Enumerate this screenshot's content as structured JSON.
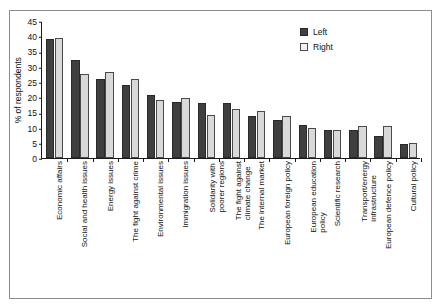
{
  "chart_data": {
    "type": "bar",
    "title": "",
    "subtitle": "",
    "xlabel": "",
    "ylabel": "% of respondents",
    "ylim": [
      0,
      45
    ],
    "ytick_step": 5,
    "yticks": [
      "45",
      "40",
      "35",
      "30",
      "25",
      "20",
      "15",
      "10",
      "5",
      "0"
    ],
    "grid": false,
    "legend_position": "top-right",
    "categories": [
      "Economic affairs",
      "Social and health issues",
      "Energy issues",
      "The fight against crime",
      "Environmental issues",
      "Immigration issues",
      "Solidarity with poorer regions",
      "The fight against climate change",
      "The internal market",
      "European foreign policy",
      "European education policy",
      "Scientific research",
      "Transport/energy infrastructure",
      "European defence policy",
      "Cultural policy"
    ],
    "category_lines": [
      [
        "Economic affairs"
      ],
      [
        "Social and health issues"
      ],
      [
        "Energy issues"
      ],
      [
        "The fight against crime"
      ],
      [
        "Environmental issues"
      ],
      [
        "Immigration issues"
      ],
      [
        "Solidarity with",
        "poorer regions"
      ],
      [
        "The fight against",
        "climate change"
      ],
      [
        "The internal market"
      ],
      [
        "European foreign policy"
      ],
      [
        "European education",
        "policy"
      ],
      [
        "Scientific research"
      ],
      [
        "Transport/energy",
        "infrastructure"
      ],
      [
        "European defence policy"
      ],
      [
        "Cultural policy"
      ]
    ],
    "series": [
      {
        "name": "Left",
        "color": "#3f3f3f",
        "values": [
          39.0,
          32.1,
          25.8,
          24.1,
          20.7,
          18.4,
          18.2,
          18.0,
          13.7,
          12.4,
          10.7,
          9.3,
          9.2,
          7.3,
          4.5
        ]
      },
      {
        "name": "Right",
        "color": "#d9d9d9",
        "values": [
          39.4,
          27.5,
          28.1,
          26.1,
          19.1,
          19.8,
          14.2,
          16.2,
          15.4,
          13.8,
          10.0,
          9.2,
          10.5,
          10.4,
          4.9
        ]
      }
    ]
  },
  "legend": {
    "items": [
      {
        "label": "Left",
        "swatch": "dark"
      },
      {
        "label": "Right",
        "swatch": "light"
      }
    ]
  }
}
